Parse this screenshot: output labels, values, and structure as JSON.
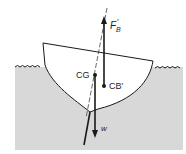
{
  "diagram": {
    "type": "heeled boat stability (buoyancy vs weight couple)",
    "labels": {
      "buoyant_force": "F",
      "buoyant_force_sub": "B",
      "buoyant_force_prime": "′",
      "center_of_gravity": "CG",
      "center_of_buoyancy": "CB′",
      "weight": "w"
    },
    "colors": {
      "water": "#d6d6d6",
      "hull_fill": "#ffffff",
      "stroke": "#1a1a1a",
      "centerline": "#444444"
    }
  }
}
